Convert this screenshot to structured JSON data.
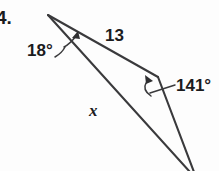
{
  "problem": {
    "number": "4.",
    "type": "triangle-angle-side-diagram"
  },
  "figure": {
    "background_color": "#fdfdfd",
    "stroke_color": "#3a3a3c",
    "text_color": "#1b1b1d",
    "labels": {
      "angle_top": "18°",
      "side_top": "13",
      "angle_right": "141°",
      "side_unknown": "x"
    },
    "vertices": {
      "apex": {
        "x": 48,
        "y": 15
      },
      "right": {
        "x": 158,
        "y": 77
      },
      "bottom": {
        "x": 192,
        "y": 172
      }
    },
    "label_positions": {
      "angle_top": {
        "x": 27,
        "y": 56
      },
      "side_top": {
        "x": 105,
        "y": 41
      },
      "angle_right": {
        "x": 176,
        "y": 91
      },
      "side_unknown": {
        "x": 89,
        "y": 116
      },
      "problem_number": {
        "x": -3,
        "y": 23
      }
    }
  }
}
